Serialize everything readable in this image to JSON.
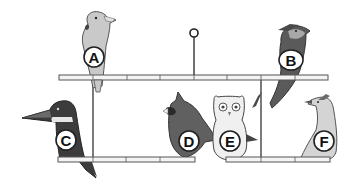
{
  "diagram": {
    "type": "mobile-bird-perches",
    "colors": {
      "perch_fill": "#f4f4f4",
      "perch_stroke": "#555555",
      "string": "#333333",
      "label_fill": "#ffffff",
      "label_stroke": "#222222",
      "bird_dark": "#4a4a4a",
      "bird_mid": "#8a8a8a",
      "bird_light": "#c8c8c8"
    },
    "birds": [
      {
        "label": "A",
        "species_icon": "cockatoo-icon",
        "perch": "top"
      },
      {
        "label": "B",
        "species_icon": "cardinal-like-crested-bird-icon",
        "perch": "top"
      },
      {
        "label": "C",
        "species_icon": "kingfisher-icon",
        "perch": "bottom-left"
      },
      {
        "label": "D",
        "species_icon": "cardinal-icon",
        "perch": "bottom-left"
      },
      {
        "label": "E",
        "species_icon": "owl-icon",
        "perch": "bottom-right"
      },
      {
        "label": "F",
        "species_icon": "roadrunner-icon",
        "perch": "bottom-right"
      }
    ]
  }
}
